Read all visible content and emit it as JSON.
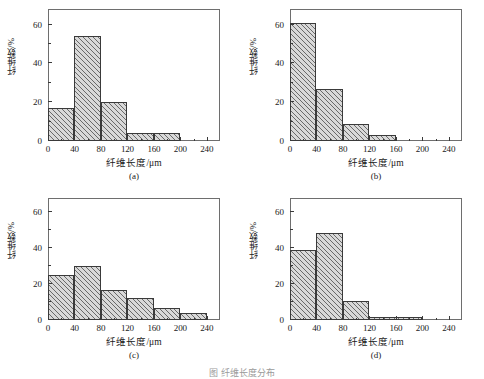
{
  "figure": {
    "caption": "图 纤维长度分布",
    "axis": {
      "xlabel": "纤维长度/μm",
      "ylabel": "纤维数/%",
      "xticks": [
        0,
        40,
        80,
        120,
        160,
        200,
        240
      ],
      "yticks": [
        0,
        20,
        40,
        60
      ],
      "xlim": [
        0,
        260
      ],
      "ylim": [
        0,
        68
      ]
    }
  },
  "chart_data": [
    {
      "type": "bar",
      "title": "(a)",
      "panel": "a",
      "xlabel": "纤维长度/μm",
      "ylabel": "纤维数/%",
      "xlim": [
        0,
        260
      ],
      "ylim": [
        0,
        68
      ],
      "xticks": [
        0,
        40,
        80,
        120,
        160,
        200,
        240
      ],
      "yticks": [
        0,
        20,
        40,
        60
      ],
      "grid": false,
      "legend": "none",
      "bin_edges": [
        0,
        40,
        80,
        120,
        160,
        200
      ],
      "categories": [
        "0-40",
        "40-80",
        "80-120",
        "120-160",
        "160-200"
      ],
      "values": [
        17,
        54,
        20,
        4,
        4
      ]
    },
    {
      "type": "bar",
      "title": "(b)",
      "panel": "b",
      "xlabel": "纤维长度/μm",
      "ylabel": "纤维数/%",
      "xlim": [
        0,
        260
      ],
      "ylim": [
        0,
        68
      ],
      "xticks": [
        0,
        40,
        80,
        120,
        160,
        200,
        240
      ],
      "yticks": [
        0,
        20,
        40,
        60
      ],
      "grid": false,
      "legend": "none",
      "bin_edges": [
        0,
        40,
        80,
        120,
        160
      ],
      "categories": [
        "0-40",
        "40-80",
        "80-120",
        "120-160"
      ],
      "values": [
        61,
        27,
        9,
        3
      ]
    },
    {
      "type": "bar",
      "title": "(c)",
      "panel": "c",
      "xlabel": "纤维长度/μm",
      "ylabel": "纤维数/%",
      "xlim": [
        0,
        260
      ],
      "ylim": [
        0,
        68
      ],
      "xticks": [
        0,
        40,
        80,
        120,
        160,
        200,
        240
      ],
      "yticks": [
        0,
        20,
        40,
        60
      ],
      "grid": false,
      "legend": "none",
      "bin_edges": [
        0,
        40,
        80,
        120,
        160,
        200,
        240
      ],
      "categories": [
        "0-40",
        "40-80",
        "80-120",
        "120-160",
        "160-200",
        "200-240"
      ],
      "values": [
        25,
        30,
        17,
        12,
        6.5,
        4
      ]
    },
    {
      "type": "bar",
      "title": "(d)",
      "panel": "d",
      "xlabel": "纤维长度/μm",
      "ylabel": "纤维数/%",
      "xlim": [
        0,
        260
      ],
      "ylim": [
        0,
        68
      ],
      "xticks": [
        0,
        40,
        80,
        120,
        160,
        200,
        240
      ],
      "yticks": [
        0,
        20,
        40,
        60
      ],
      "grid": false,
      "legend": "none",
      "bin_edges": [
        0,
        40,
        80,
        120,
        200
      ],
      "categories": [
        "0-40",
        "40-80",
        "80-120",
        "120-200"
      ],
      "values": [
        39,
        48.5,
        10.5,
        1.5
      ]
    }
  ],
  "panels": {
    "a": {
      "label": "(a)"
    },
    "b": {
      "label": "(b)"
    },
    "c": {
      "label": "(c)"
    },
    "d": {
      "label": "(d)"
    }
  },
  "colors": {
    "bar_fill": "#d9d9d9",
    "bar_edge": "#3a3a3a",
    "frame": "#6e6e6e",
    "text": "#1a1a1a"
  }
}
